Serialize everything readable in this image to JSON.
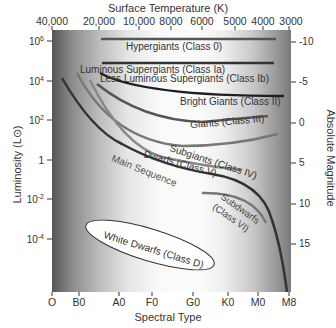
{
  "diagram": {
    "title_top": "Surface Temperature (K)",
    "xlabel": "Spectral Type",
    "ylabel_left": "Luminosity (L⊙)",
    "ylabel_right": "Absolute Magnitude",
    "top_ticks": [
      "40,000",
      "20,000",
      "10,000",
      "8000",
      "6000",
      "5000",
      "4000",
      "3000"
    ],
    "bottom_ticks": [
      "O",
      "B0",
      "A0",
      "F0",
      "G0",
      "K0",
      "M0",
      "M8"
    ],
    "left_ticks": [
      {
        "base": "10",
        "exp": "6"
      },
      {
        "base": "10",
        "exp": "4"
      },
      {
        "base": "10",
        "exp": "2"
      },
      {
        "base": "1",
        "exp": ""
      },
      {
        "base": "10",
        "exp": "-2"
      },
      {
        "base": "10",
        "exp": "-4"
      }
    ],
    "right_ticks": [
      "-10",
      "-5",
      "0",
      "5",
      "10",
      "15"
    ],
    "regions": {
      "hypergiants": "Hypergiants (Class 0)",
      "lum_supergiants": "Luminous Supergiants (Class Ia)",
      "less_lum_supergiants": "Less Luminous Supergiants (Class Ib)",
      "bright_giants": "Bright Giants (Class II)",
      "giants": "Giants (Class III)",
      "subgiants": "Subgiants (Class IV)",
      "dwarfs": "Dwarfs (Class V)",
      "main_sequence": "Main Sequence",
      "subdwarfs_1": "Subdwarfs",
      "subdwarfs_2": "(Class VI)",
      "white_dwarfs": "White Dwarfs (Class D)"
    }
  }
}
